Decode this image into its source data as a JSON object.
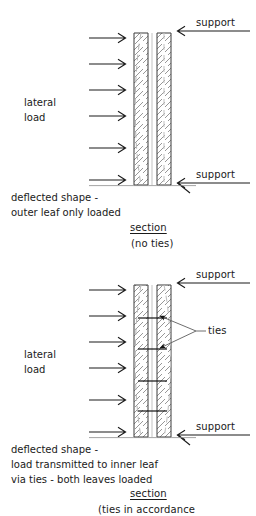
{
  "diagram": {
    "colors": {
      "ink": "#1a1a1a",
      "masonry_outline": "#3a3a3a",
      "hatch": "#555555",
      "deflection_dashed": "#b4b4b4",
      "tie": "#111111",
      "background": "#ffffff"
    }
  },
  "top_figure": {
    "name": "section-no-ties",
    "load_label_line1": "lateral",
    "load_label_line2": "load",
    "support_top_label": "support",
    "support_bottom_label": "support",
    "deflected_note_line1": "deflected shape -",
    "deflected_note_line2": "outer leaf only loaded",
    "caption_title": "section",
    "caption_sub": "(no ties)",
    "load_arrow_count": 6
  },
  "bottom_figure": {
    "name": "section-with-ties",
    "load_label_line1": "lateral",
    "load_label_line2": "load",
    "support_top_label": "support",
    "support_bottom_label": "support",
    "ties_label": "ties",
    "deflected_note_line1": "deflected shape -",
    "deflected_note_line2": "load transmitted to inner leaf",
    "deflected_note_line3": "via ties - both leaves loaded",
    "caption_title": "section",
    "caption_sub": "(ties in accordance",
    "load_arrow_count": 6,
    "tie_count": 4
  }
}
